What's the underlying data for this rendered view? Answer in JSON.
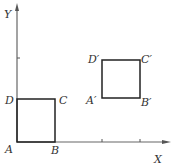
{
  "diagram": {
    "axes": {
      "x_label": "X",
      "y_label": "Y"
    },
    "square_original": {
      "vertices": {
        "A": "A",
        "B": "B",
        "C": "C",
        "D": "D"
      }
    },
    "square_translated": {
      "vertices": {
        "A": "A′",
        "B": "B′",
        "C": "C′",
        "D": "D′"
      }
    },
    "colors": {
      "axis": "#555555",
      "square": "#222222",
      "label": "#333333"
    }
  }
}
